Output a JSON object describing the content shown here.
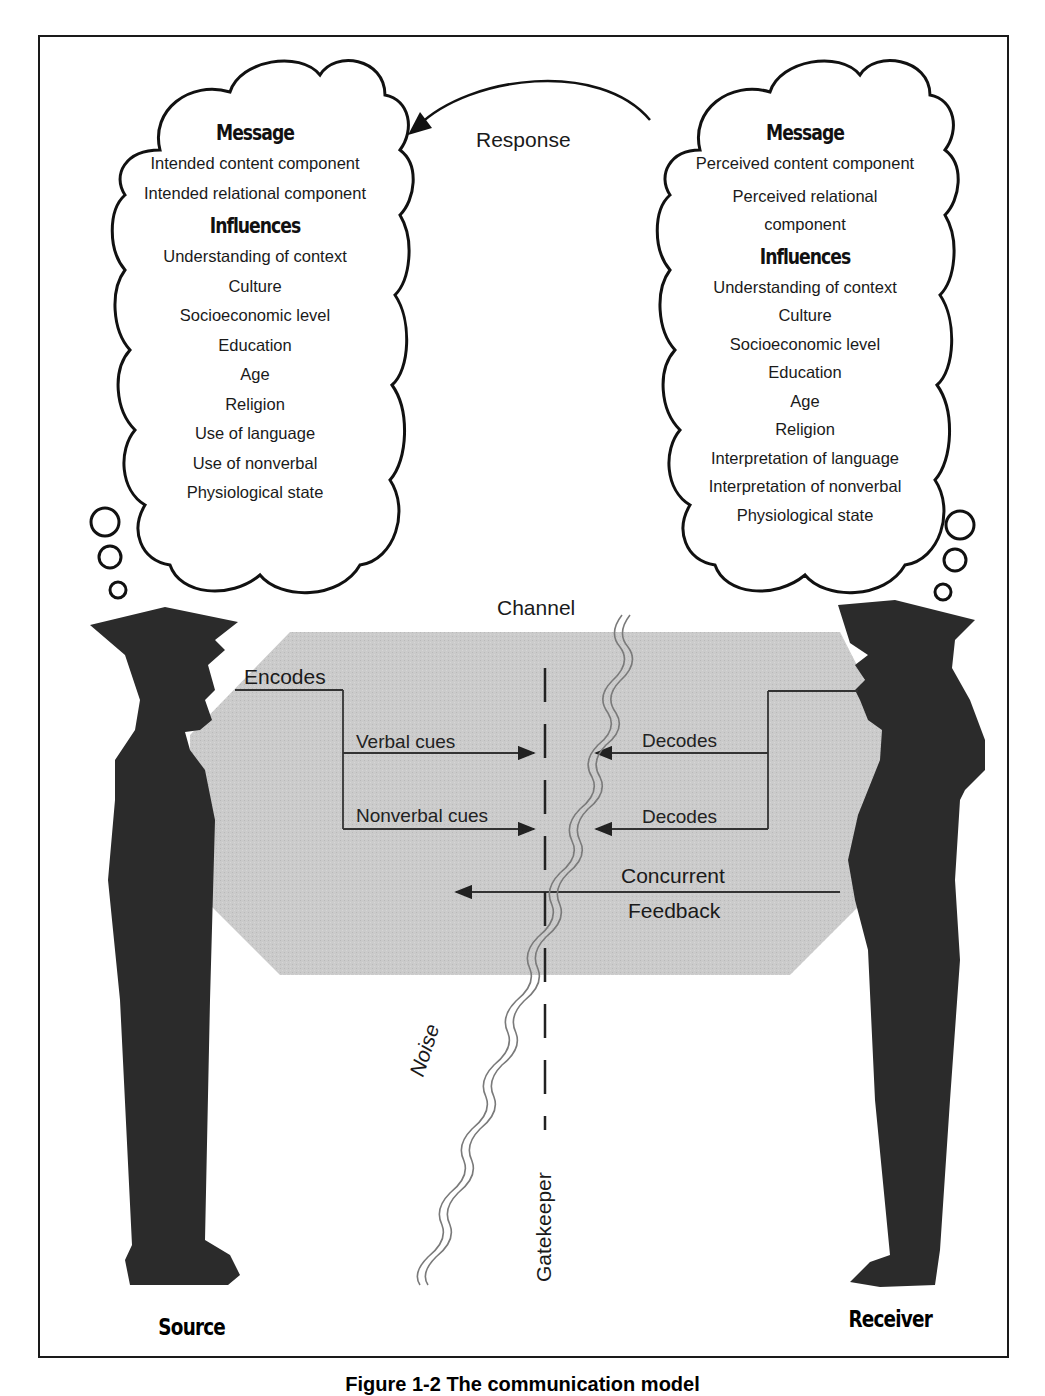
{
  "figure": {
    "caption": "Figure 1-2 The communication model"
  },
  "source_cloud": {
    "message_heading": "Message",
    "message_items": [
      "Intended content component",
      "Intended relational component"
    ],
    "influences_heading": "Influences",
    "influences_items": [
      "Understanding of context",
      "Culture",
      "Socioeconomic level",
      "Education",
      "Age",
      "Religion",
      "Use of language",
      "Use of nonverbal",
      "Physiological state"
    ]
  },
  "receiver_cloud": {
    "message_heading": "Message",
    "message_items": [
      "Perceived content component",
      "Perceived relational component"
    ],
    "influences_heading": "Influences",
    "influences_items": [
      "Understanding of context",
      "Culture",
      "Socioeconomic level",
      "Education",
      "Age",
      "Religion",
      "Interpretation of language",
      "Interpretation of nonverbal",
      "Physiological state"
    ]
  },
  "response_label": "Response",
  "channel": {
    "label": "Channel",
    "encodes_label": "Encodes",
    "verbal_cues_label": "Verbal cues",
    "nonverbal_cues_label": "Nonverbal cues",
    "decodes_verbal_label": "Decodes",
    "decodes_nonverbal_label": "Decodes",
    "feedback_line1": "Concurrent",
    "feedback_line2": "Feedback",
    "noise_label": "Noise",
    "gatekeeper_label": "Gatekeeper"
  },
  "roles": {
    "source": "Source",
    "receiver": "Receiver"
  },
  "colors": {
    "ink": "#1a1a1a",
    "silhouette": "#2b2b2b",
    "channel_fill": "#c9c9c9",
    "noise_stroke": "#8a8a8a",
    "background": "#ffffff"
  }
}
